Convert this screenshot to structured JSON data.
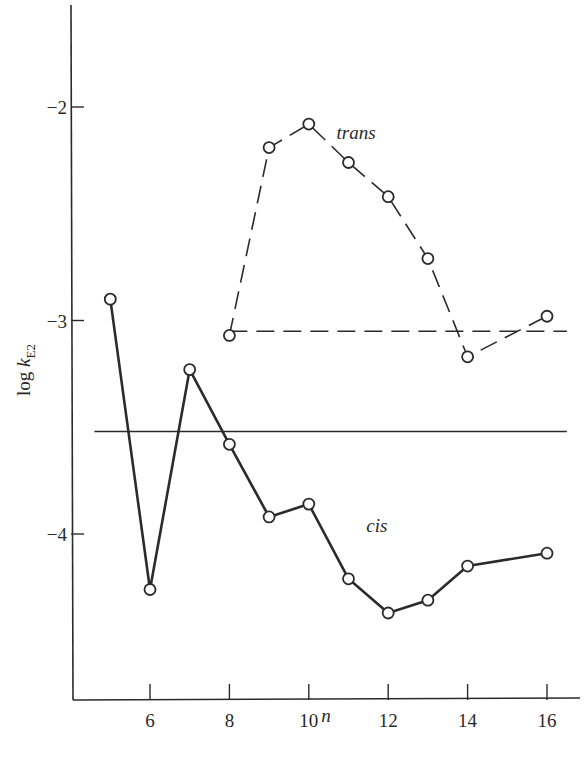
{
  "chart_data": {
    "type": "line",
    "title": "",
    "xlabel": "n",
    "ylabel": "log k_E2",
    "ylabel_parts": {
      "main": "log ",
      "k": "k",
      "sub": "E2"
    },
    "xlim": [
      4.0,
      16.5
    ],
    "ylim": [
      -4.8,
      -1.0
    ],
    "x_ticks": [
      6,
      8,
      10,
      12,
      14,
      16
    ],
    "x_tick_labels": [
      "6",
      "8",
      "10",
      "12",
      "14",
      "16"
    ],
    "y_ticks": [
      -2,
      -3,
      -4
    ],
    "y_tick_labels": [
      "−2",
      "−3",
      "−4"
    ],
    "grid": false,
    "legend": null,
    "series": [
      {
        "name": "cis",
        "style": "solid",
        "marker": "open-circle",
        "x": [
          5,
          6,
          7,
          8,
          9,
          10,
          11,
          12,
          13,
          14,
          16
        ],
        "values": [
          -2.9,
          -4.26,
          -3.23,
          -3.58,
          -3.92,
          -3.86,
          -4.21,
          -4.37,
          -4.31,
          -4.15,
          -4.09
        ]
      },
      {
        "name": "trans",
        "style": "dashed",
        "marker": "open-circle",
        "x": [
          8,
          9,
          10,
          11,
          12,
          13,
          14,
          16
        ],
        "values": [
          -3.07,
          -2.19,
          -2.08,
          -2.26,
          -2.42,
          -2.71,
          -3.17,
          -2.98
        ]
      }
    ],
    "reference_lines": [
      {
        "name": "cis-reference",
        "style": "solid",
        "y": -3.52,
        "x_from": 4.6,
        "x_to": 16.5
      },
      {
        "name": "trans-reference",
        "style": "dashed",
        "y": -3.05,
        "x_from": 8.0,
        "x_to": 16.5
      }
    ],
    "annotations": [
      {
        "text": "trans",
        "x": 10.7,
        "y": -2.15
      },
      {
        "text": "cis",
        "x": 11.45,
        "y": -3.99
      }
    ]
  }
}
